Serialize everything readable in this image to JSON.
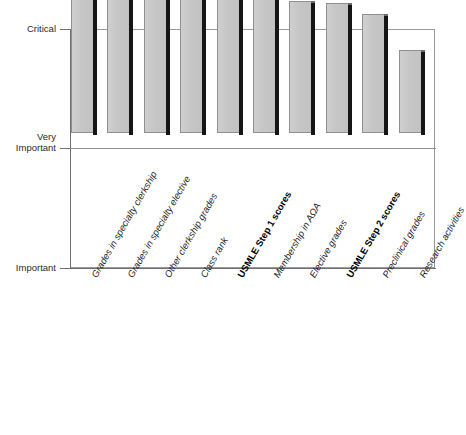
{
  "chart_data": {
    "type": "bar",
    "title": "",
    "xlabel": "",
    "ylabel": "",
    "grid": true,
    "legend": "none",
    "orientation": "vertical",
    "ytick_labels": [
      "Critical",
      "Very\nImportant",
      "Important"
    ],
    "ylim_labels": [
      "Important",
      "Critical"
    ],
    "ylim": [
      0,
      100
    ],
    "categories": [
      "Grades in specialty clerkship",
      "Grades in specialty elective",
      "Other clerkship grades",
      "Class rank",
      "USMLE Step 1 scores",
      "Membership in AΩA",
      "Elective grades",
      "USMLE Step 2 scores",
      "Preclinical grades",
      "Research activities"
    ],
    "values": [
      100,
      84.5,
      77.8,
      77.8,
      62.3,
      59.4,
      55.2,
      54.4,
      49.8,
      34.7
    ],
    "emphasis": [
      false,
      false,
      false,
      false,
      true,
      false,
      false,
      true,
      false,
      false
    ],
    "colors": {
      "bar_face": "#c9c9c9",
      "bar_edge_shadow": "#151515",
      "bar_outline": "#8f8f8f",
      "axis": "#6f6f6f",
      "gridline": "#8e8e8e",
      "frame": "#9a9a9a",
      "text": "#222222",
      "background": "#ffffff"
    }
  },
  "axis": {
    "y": {
      "critical": "Critical",
      "very_important": "Very\nImportant",
      "important": "Important"
    }
  }
}
